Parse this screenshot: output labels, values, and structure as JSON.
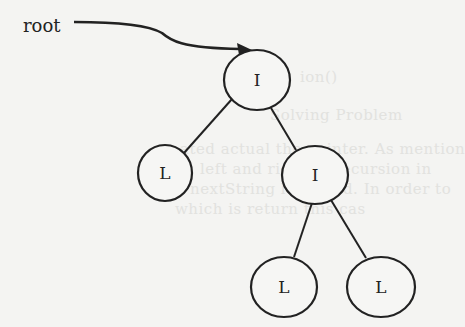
{
  "diagram": {
    "type": "binary-tree",
    "pointer_label": "root",
    "nodes": [
      {
        "id": "root",
        "label": "I",
        "kind": "internal"
      },
      {
        "id": "left-leaf",
        "label": "L",
        "kind": "leaf"
      },
      {
        "id": "right-internal",
        "label": "I",
        "kind": "internal"
      },
      {
        "id": "right-left-leaf",
        "label": "L",
        "kind": "leaf"
      },
      {
        "id": "right-right-leaf",
        "label": "L",
        "kind": "leaf"
      }
    ],
    "edges": [
      [
        "root",
        "left-leaf"
      ],
      [
        "root",
        "right-internal"
      ],
      [
        "right-internal",
        "right-left-leaf"
      ],
      [
        "right-internal",
        "right-right-leaf"
      ]
    ]
  },
  "colors": {
    "stroke": "#222222",
    "background": "#f4f4f2"
  }
}
